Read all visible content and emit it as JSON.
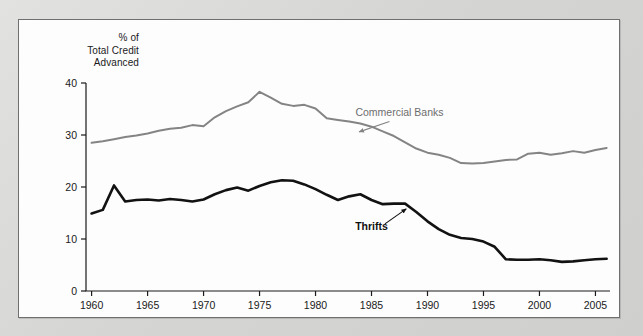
{
  "figure": {
    "card_background": "#fdfdfd",
    "page_background": "#d9d9d7",
    "border_color": "#6f6f6f"
  },
  "axis_title": {
    "line1": "% of",
    "line2": "Total Credit",
    "line3": "Advanced"
  },
  "annotations": {
    "banks_label": "Commercial Banks",
    "thrifts_label": "Thrifts"
  },
  "chart_data": {
    "type": "line",
    "title": "",
    "subtitle": "",
    "xlabel": "",
    "ylabel": "% of Total Credit Advanced",
    "xlim": [
      1959.5,
      2006.3
    ],
    "ylim": [
      0,
      40
    ],
    "yticks": [
      0,
      10,
      20,
      30,
      40
    ],
    "ytick_labels": [
      "0",
      "10",
      "20",
      "30",
      "40"
    ],
    "xticks": [
      1960,
      1965,
      1970,
      1975,
      1980,
      1985,
      1990,
      1995,
      2000,
      2005
    ],
    "xtick_labels": [
      "1960",
      "1965",
      "1970",
      "1975",
      "1980",
      "1985",
      "1990",
      "1995",
      "2000",
      "2005"
    ],
    "grid": false,
    "legend": "inline-annotations",
    "legend_position": "inline",
    "series": [
      {
        "name": "Commercial Banks",
        "color": "#848484",
        "line_width": 2.0,
        "label_anchor": [
          1987.5,
          33.6
        ],
        "arrow_from": [
          1986.6,
          32.6
        ],
        "arrow_to": [
          1983.9,
          30.6
        ],
        "x": [
          1960,
          1961,
          1962,
          1963,
          1964,
          1965,
          1966,
          1967,
          1968,
          1969,
          1970,
          1971,
          1972,
          1973,
          1974,
          1975,
          1976,
          1977,
          1978,
          1979,
          1980,
          1981,
          1982,
          1983,
          1984,
          1985,
          1986,
          1987,
          1988,
          1989,
          1990,
          1991,
          1992,
          1993,
          1994,
          1995,
          1996,
          1997,
          1998,
          1999,
          2000,
          2001,
          2002,
          2003,
          2004,
          2005,
          2006
        ],
        "values": [
          28.5,
          28.8,
          29.2,
          29.6,
          29.9,
          30.3,
          30.8,
          31.2,
          31.4,
          31.9,
          31.7,
          33.4,
          34.6,
          35.5,
          36.3,
          38.3,
          37.2,
          36.0,
          35.6,
          35.8,
          35.1,
          33.2,
          32.9,
          32.6,
          32.2,
          31.6,
          30.7,
          29.8,
          28.6,
          27.4,
          26.6,
          26.2,
          25.6,
          24.6,
          24.5,
          24.6,
          24.9,
          25.2,
          25.3,
          26.4,
          26.6,
          26.2,
          26.5,
          26.9,
          26.6,
          27.1,
          27.5
        ]
      },
      {
        "name": "Thrifts",
        "color": "#121212",
        "line_width": 2.6,
        "label_anchor": [
          1985.0,
          11.8
        ],
        "arrow_from": [
          1986.2,
          12.9
        ],
        "arrow_to": [
          1988.1,
          15.8
        ],
        "x": [
          1960,
          1961,
          1962,
          1963,
          1964,
          1965,
          1966,
          1967,
          1968,
          1969,
          1970,
          1971,
          1972,
          1973,
          1974,
          1975,
          1976,
          1977,
          1978,
          1979,
          1980,
          1981,
          1982,
          1983,
          1984,
          1985,
          1986,
          1987,
          1988,
          1989,
          1990,
          1991,
          1992,
          1993,
          1994,
          1995,
          1996,
          1997,
          1998,
          1999,
          2000,
          2001,
          2002,
          2003,
          2004,
          2005,
          2006
        ],
        "values": [
          14.9,
          15.6,
          20.3,
          17.2,
          17.5,
          17.6,
          17.4,
          17.7,
          17.5,
          17.2,
          17.6,
          18.6,
          19.4,
          19.9,
          19.3,
          20.2,
          20.9,
          21.3,
          21.2,
          20.5,
          19.6,
          18.5,
          17.5,
          18.2,
          18.6,
          17.5,
          16.7,
          16.8,
          16.8,
          15.2,
          13.4,
          11.9,
          10.8,
          10.2,
          10.0,
          9.5,
          8.5,
          6.1,
          6.0,
          6.0,
          6.1,
          5.9,
          5.6,
          5.7,
          5.9,
          6.1,
          6.2
        ]
      }
    ]
  }
}
